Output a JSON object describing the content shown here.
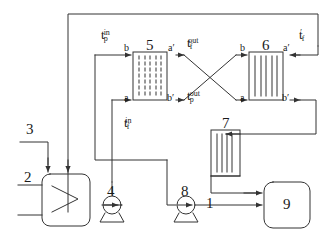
{
  "diagram": {
    "stroke_color": "#333333",
    "background": "#ffffff",
    "equipment": [
      {
        "id": "1",
        "label": "1",
        "type": "tank-with-coil",
        "x": 212,
        "y": 205
      },
      {
        "id": "2",
        "label": "2",
        "type": "inlet-stream",
        "x": 30,
        "y": 178
      },
      {
        "id": "3",
        "label": "3",
        "type": "inlet-stream",
        "x": 32,
        "y": 130
      },
      {
        "id": "4",
        "label": "4",
        "type": "pump",
        "x": 112,
        "y": 192
      },
      {
        "id": "5",
        "label": "5",
        "type": "heat-exchanger-dashed",
        "x": 153,
        "y": 48
      },
      {
        "id": "6",
        "label": "6",
        "type": "heat-exchanger-solid",
        "x": 268,
        "y": 48
      },
      {
        "id": "7",
        "label": "7",
        "type": "heat-exchanger-vertical",
        "x": 232,
        "y": 122
      },
      {
        "id": "8",
        "label": "8",
        "type": "pump",
        "x": 186,
        "y": 192
      },
      {
        "id": "9",
        "label": "9",
        "type": "tank",
        "x": 292,
        "y": 205
      }
    ],
    "port_labels": [
      {
        "name": "hx5-top-left",
        "text": "b",
        "x": 128,
        "y": 49
      },
      {
        "name": "hx5-top-right",
        "text": "a′",
        "x": 171,
        "y": 49
      },
      {
        "name": "hx5-bottom-left",
        "text": "a",
        "x": 128,
        "y": 97
      },
      {
        "name": "hx5-bottom-right",
        "text": "b′",
        "x": 170,
        "y": 97
      },
      {
        "name": "hx6-top-left",
        "text": "b",
        "x": 243,
        "y": 49
      },
      {
        "name": "hx6-top-right",
        "text": "a′",
        "x": 286,
        "y": 49
      },
      {
        "name": "hx6-bottom-left",
        "text": "a",
        "x": 243,
        "y": 97
      },
      {
        "name": "hx6-bottom-right",
        "text": "b′",
        "x": 285,
        "y": 97
      }
    ],
    "temperatures": [
      {
        "name": "t-p-in",
        "base": "t",
        "sub": "p",
        "sup": "in",
        "x": 103,
        "y": 32
      },
      {
        "name": "t-f-out",
        "base": "t",
        "sub": "f",
        "sup": "out",
        "x": 190,
        "y": 40
      },
      {
        "name": "t-f-prime",
        "base": "t",
        "sub": "f",
        "sup": "′",
        "x": 301,
        "y": 32
      },
      {
        "name": "t-p-out",
        "base": "t",
        "sub": "p",
        "sup": "out",
        "x": 190,
        "y": 93
      },
      {
        "name": "t-f-in",
        "base": "t",
        "sub": "f",
        "sup": "in",
        "x": 126,
        "y": 120
      }
    ]
  }
}
